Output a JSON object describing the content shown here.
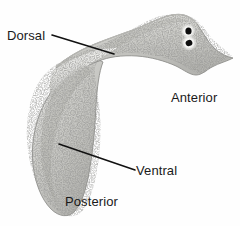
{
  "figure": {
    "kind": "biology-specimen-photograph",
    "background_color": "#fefefe",
    "width": 240,
    "height": 226
  },
  "specimen": {
    "body_color_light": "#e8e8e6",
    "body_color_mid": "#c9c9c6",
    "body_color_dark": "#9d9d99",
    "outline_color": "#8a8a86",
    "speckle_color": "#6b6b67",
    "eyespot_color": "#0d0d0d",
    "eyespot_halo_color": "#f4f4f2",
    "parts": {
      "head": "anterior-head-with-auricles",
      "eyespots": "paired-ocelli",
      "trunk": "dorsal-surface",
      "tail": "posterior-tapered-tip",
      "fold": "body-twist-fold"
    }
  },
  "annotations": {
    "line_color": "#111111",
    "line_width": 1.6,
    "items": [
      {
        "id": "dorsal",
        "label": "Dorsal",
        "leader": {
          "x1": 52,
          "y1": 35,
          "x2": 114,
          "y2": 54
        }
      },
      {
        "id": "anterior",
        "label": "Anterior",
        "leader": null
      },
      {
        "id": "ventral",
        "label": "Ventral",
        "leader": {
          "x1": 59,
          "y1": 144,
          "x2": 135,
          "y2": 170
        }
      },
      {
        "id": "posterior",
        "label": "Posterior",
        "leader": null
      }
    ]
  }
}
